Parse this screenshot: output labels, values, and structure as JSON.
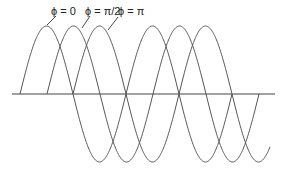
{
  "figure": {
    "type": "phase-shifted sine waves",
    "labels": [
      {
        "text": "ϕ = 0",
        "phase": "0"
      },
      {
        "text": "ϕ = π/2",
        "phase": "pi/2"
      },
      {
        "text": "ϕ = π",
        "phase": "pi"
      }
    ],
    "axis": {
      "x1": 12,
      "x2": 275,
      "y": 94
    },
    "amplitude_px": 68,
    "period_px": 106,
    "curves": [
      {
        "name": "phi-0",
        "start_x": 20,
        "end_x": 232
      },
      {
        "name": "phi-pi-2",
        "start_x": 47,
        "end_x": 259
      },
      {
        "name": "phi-pi",
        "start_x": 73,
        "end_x": 270
      }
    ],
    "colors": {
      "curve": "#555555",
      "axis": "#444444",
      "text": "#222222"
    }
  }
}
